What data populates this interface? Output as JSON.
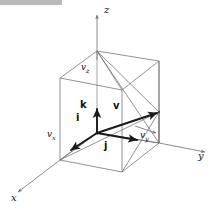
{
  "figure": {
    "kind": "diagram",
    "topic": "Vector decomposition in 3D Cartesian coordinates",
    "background_color": "#ffffff",
    "line_color": "#6f6f6f",
    "bold_line_color": "#1a1a1a",
    "header_bar": {
      "name": "redaction-bar",
      "color": "#b9b9b9",
      "x": 0,
      "y": 0,
      "width": 62,
      "height": 5
    },
    "axes": [
      {
        "id": "x",
        "label": "x",
        "label_x": 12,
        "label_y": 196,
        "arrow_from": [
          60,
          160
        ],
        "arrow_to": [
          18,
          192
        ]
      },
      {
        "id": "y",
        "label": "y",
        "label_x": 198,
        "label_y": 156,
        "arrow_from": [
          159,
          143
        ],
        "arrow_to": [
          205,
          152
        ]
      },
      {
        "id": "z",
        "label": "z",
        "label_x": 104,
        "label_y": 10,
        "arrow_from": [
          97,
          60
        ],
        "arrow_to": [
          97,
          15
        ]
      }
    ],
    "vectors": [
      {
        "id": "v",
        "label": "v",
        "label_x": 113,
        "label_y": 104,
        "from": [
          97,
          133
        ],
        "to": [
          159,
          112
        ],
        "bold": true
      },
      {
        "id": "i",
        "label": "i",
        "label_x": 76,
        "label_y": 113,
        "from": [
          97,
          133
        ],
        "to": [
          70,
          151
        ],
        "bold": true
      },
      {
        "id": "j",
        "label": "j",
        "label_x": 104,
        "label_y": 143,
        "from": [
          97,
          133
        ],
        "to": [
          139,
          141
        ],
        "bold": true
      },
      {
        "id": "k",
        "label": "k",
        "label_x": 79,
        "label_y": 101,
        "from": [
          97,
          133
        ],
        "to": [
          97,
          107
        ],
        "bold": true
      }
    ],
    "components": [
      {
        "id": "vz",
        "label": "v",
        "sub": "z",
        "label_x": 82,
        "label_y": 68
      },
      {
        "id": "vx",
        "label": "v",
        "sub": "x",
        "label_x": 48,
        "label_y": 135
      },
      {
        "id": "vy",
        "label": "v",
        "sub": "y",
        "label_x": 141,
        "label_y": 136
      }
    ],
    "box": {
      "description": "rectangular box (cube) with the origin at the top-near corner of the base and vector v reaching the opposite corner",
      "origin": [
        97,
        133
      ],
      "tip": [
        159,
        112
      ],
      "top_apex": [
        97,
        51
      ]
    }
  }
}
